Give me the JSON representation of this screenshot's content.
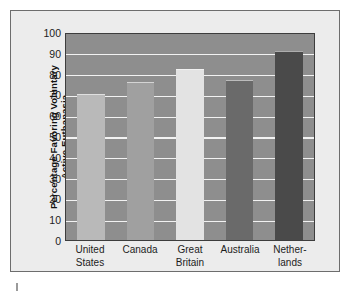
{
  "chart_data": {
    "type": "bar",
    "title": "",
    "xlabel": "",
    "ylabel": "Percentage Favoring Voluntary Active Euthanasia",
    "ylabel_line1": "Percentage Favoring Voluntary",
    "ylabel_line2": "Active Euthanasia",
    "categories": [
      "United States",
      "Canada",
      "Great Britain",
      "Australia",
      "Netherlands"
    ],
    "category_lines": [
      {
        "line1": "United",
        "line2": "States"
      },
      {
        "line1": "Canada",
        "line2": ""
      },
      {
        "line1": "Great",
        "line2": "Britain"
      },
      {
        "line1": "Australia",
        "line2": ""
      },
      {
        "line1": "Nether-",
        "line2": "lands"
      }
    ],
    "values": [
      70,
      76,
      82,
      77,
      91
    ],
    "ylim": [
      0,
      100
    ],
    "ytick_values": [
      100,
      90,
      80,
      70,
      60,
      50,
      40,
      30,
      20,
      10,
      0
    ],
    "ytick_labels": [
      "100",
      "90",
      "80",
      "70",
      "60",
      "50",
      "40",
      "30",
      "20",
      "10",
      "0"
    ],
    "grid": true,
    "gridline_color": "#f2f2f2",
    "legend": null,
    "legend_position": "none",
    "bar_colors": [
      "#b9b9b9",
      "#a0a0a0",
      "#e3e3e3",
      "#6a6a6a",
      "#4a4a4a"
    ],
    "plot_background": "#8e8e8e",
    "figure_background": "#ececec",
    "axis_color": "#3d3d3d",
    "text_color": "#1c1c1c"
  }
}
